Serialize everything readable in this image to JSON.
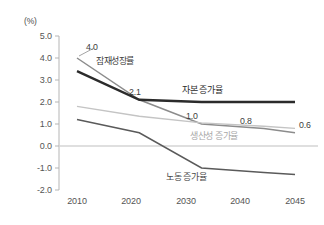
{
  "chart_data": {
    "type": "line",
    "title": "",
    "subtitle": "",
    "unit_label": "(%)",
    "xlabel": "",
    "ylabel": "",
    "x": [
      2010,
      2020,
      2030,
      2040,
      2045
    ],
    "xticklabels": [
      "2010",
      "2020",
      "2030",
      "2040",
      "2045"
    ],
    "yticklabels": [
      "5.0",
      "4.0",
      "3.0",
      "2.0",
      "1.0",
      "0.0",
      "-1.0",
      "-2.0"
    ],
    "yticks": [
      5.0,
      4.0,
      3.0,
      2.0,
      1.0,
      0.0,
      -1.0,
      -2.0
    ],
    "ylim": [
      -2.0,
      5.0
    ],
    "xlim": [
      2010,
      2045
    ],
    "grid": false,
    "zero_line": true,
    "legend_position": "inline-annotations",
    "series": [
      {
        "name": "잠재성장률",
        "color": "#8c8c8c",
        "width": 1.5,
        "values": [
          4.0,
          2.1,
          1.0,
          0.8,
          0.6
        ]
      },
      {
        "name": "자본 증가율",
        "color": "#2b2b2b",
        "width": 2.4,
        "values": [
          3.4,
          2.1,
          2.0,
          2.0,
          2.0
        ]
      },
      {
        "name": "생산성 증가율",
        "color": "#c4c4c4",
        "width": 1.4,
        "values": [
          1.8,
          1.35,
          1.05,
          0.9,
          0.8
        ]
      },
      {
        "name": "노동 증가율",
        "color": "#5a5a5a",
        "width": 1.5,
        "values": [
          1.2,
          0.6,
          -1.0,
          -1.2,
          -1.3
        ]
      }
    ],
    "data_labels": [
      {
        "text": "4.0",
        "series": "잠재성장률",
        "x": 2010,
        "value": 4.0
      },
      {
        "text": "2.1",
        "series": "잠재성장률",
        "x": 2020,
        "value": 2.1
      },
      {
        "text": "1.0",
        "series": "잠재성장률",
        "x": 2030,
        "value": 1.0
      },
      {
        "text": "0.8",
        "series": "잠재성장률",
        "x": 2040,
        "value": 0.8
      },
      {
        "text": "0.6",
        "series": "잠재성장률",
        "x": 2045,
        "value": 0.6
      }
    ],
    "annotations": [
      {
        "text": "잠재성장률",
        "series": "잠재성장률"
      },
      {
        "text": "자본 증가율",
        "series": "자본 증가율"
      },
      {
        "text": "생산성 증가율",
        "series": "생산성 증가율"
      },
      {
        "text": "노동 증가율",
        "series": "노동 증가율"
      }
    ],
    "colors": {
      "potential_growth": "#8c8c8c",
      "capital_growth": "#2b2b2b",
      "productivity_growth": "#c4c4c4",
      "labor_growth": "#5a5a5a",
      "axis": "#b0b0b0",
      "text": "#545454",
      "background": "#ffffff"
    }
  }
}
